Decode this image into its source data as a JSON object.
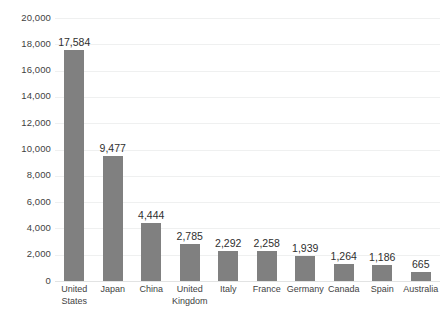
{
  "chart_data": {
    "type": "bar",
    "title": "",
    "subtitle": "",
    "xlabel": "",
    "ylabel": "",
    "ylim": [
      0,
      20000
    ],
    "ytick_step": 2000,
    "ytick_labels": [
      "0",
      "2,000",
      "4,000",
      "6,000",
      "8,000",
      "10,000",
      "12,000",
      "14,000",
      "16,000",
      "18,000",
      "20,000"
    ],
    "ytick_values": [
      0,
      2000,
      4000,
      6000,
      8000,
      10000,
      12000,
      14000,
      16000,
      18000,
      20000
    ],
    "grid": true,
    "grid_axis": "y",
    "legend": false,
    "legend_position": "none",
    "data_labels": true,
    "categories": [
      "United States",
      "Japan",
      "China",
      "United Kingdom",
      "Italy",
      "France",
      "Germany",
      "Canada",
      "Spain",
      "Australia"
    ],
    "values": [
      17584,
      9477,
      4444,
      2785,
      2292,
      2258,
      1939,
      1264,
      1186,
      665
    ],
    "value_labels": [
      "17,584",
      "9,477",
      "4,444",
      "2,785",
      "2,292",
      "2,258",
      "1,939",
      "1,264",
      "1,186",
      "665"
    ],
    "series": [
      {
        "name": "",
        "values": [
          17584,
          9477,
          4444,
          2785,
          2292,
          2258,
          1939,
          1264,
          1186,
          665
        ],
        "color": "#808080"
      }
    ]
  },
  "style": {
    "bar_color": "#808080",
    "gridline_color": "#eff0f0",
    "baseline_color": "#e2e3e3",
    "text_color": "#3f3f3f",
    "label_color": "#2f2f2f",
    "background": "#ffffff"
  }
}
